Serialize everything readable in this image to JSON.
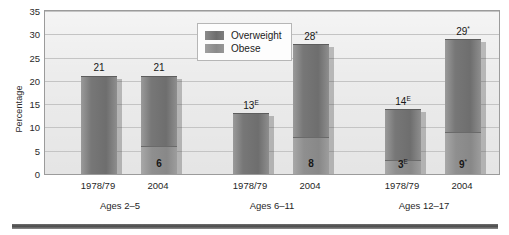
{
  "chart_data": {
    "type": "bar",
    "title": "",
    "xlabel": "",
    "ylabel": "Percentage",
    "ylim": [
      0,
      35
    ],
    "ytick_step": 5,
    "yticks": [
      "35",
      "30",
      "25",
      "20",
      "15",
      "10",
      "5",
      "0"
    ],
    "grid": true,
    "stacked": true,
    "legend_position": "top-center",
    "legend": [
      "Overweight",
      "Obese"
    ],
    "groups": [
      {
        "label": "Ages 2–5",
        "bars": [
          {
            "x": "1978/79",
            "total_label": "21",
            "total_value": 21,
            "total_marker": "",
            "obese_label": "",
            "obese_value": 0,
            "obese_marker": ""
          },
          {
            "x": "2004",
            "total_label": "21",
            "total_value": 21,
            "total_marker": "",
            "obese_label": "6",
            "obese_value": 6,
            "obese_marker": ""
          }
        ]
      },
      {
        "label": "Ages 6–11",
        "bars": [
          {
            "x": "1978/79",
            "total_label": "13",
            "total_value": 13,
            "total_marker": "E",
            "obese_label": "",
            "obese_value": 0,
            "obese_marker": ""
          },
          {
            "x": "2004",
            "total_label": "28",
            "total_value": 28,
            "total_marker": "*",
            "obese_label": "8",
            "obese_value": 8,
            "obese_marker": ""
          }
        ]
      },
      {
        "label": "Ages 12–17",
        "bars": [
          {
            "x": "1978/79",
            "total_label": "14",
            "total_value": 14,
            "total_marker": "E",
            "obese_label": "3",
            "obese_value": 3,
            "obese_marker": "E"
          },
          {
            "x": "2004",
            "total_label": "29",
            "total_value": 29,
            "total_marker": "*",
            "obese_label": "9",
            "obese_value": 9,
            "obese_marker": "*"
          }
        ]
      }
    ],
    "colors": {
      "overweight": "#6e6e6e",
      "obese": "#8f8f8f",
      "plot_background": "#ececec",
      "gridline": "#c4c4c4",
      "frame": "#9b9b9b",
      "rule": "#4a4a4a"
    }
  }
}
